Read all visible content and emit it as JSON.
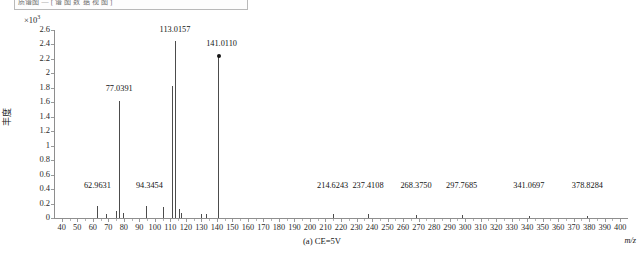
{
  "window": {
    "title_strip_text": "质谱图  —  [ 谱 图 数 据 视 图 ]"
  },
  "axes": {
    "y_exponent_prefix": "×10",
    "y_exponent_power": "3",
    "y_label": "丰度",
    "y_ticks": [
      "2.6",
      "2.4",
      "2.2",
      "2",
      "1.8",
      "1.6",
      "1.4",
      "1.2",
      "1",
      "0.8",
      "0.6",
      "0.4",
      "0.2",
      "0"
    ],
    "y_min": 0,
    "y_max": 2.6,
    "x_ticks": [
      "40",
      "50",
      "60",
      "70",
      "80",
      "90",
      "100",
      "110",
      "120",
      "130",
      "140",
      "150",
      "160",
      "170",
      "180",
      "190",
      "200",
      "210",
      "220",
      "230",
      "240",
      "250",
      "260",
      "270",
      "280",
      "290",
      "300",
      "310",
      "320",
      "330",
      "340",
      "350",
      "360",
      "370",
      "380",
      "390",
      "400"
    ],
    "x_min": 35,
    "x_max": 405,
    "x_axis_label": "m/z"
  },
  "caption": "(a) CE=5V",
  "colors": {
    "peak": "#4c4c4c",
    "axis": "#8e8e8e",
    "text": "#141414",
    "marker": "#151515"
  },
  "chart_data": {
    "type": "bar",
    "title": "",
    "subtitle": "",
    "xlabel": "m/z",
    "ylabel": "丰度",
    "y_scale_factor": 1000,
    "xlim": [
      35,
      405
    ],
    "ylim": [
      0,
      2.6
    ],
    "grid": false,
    "legend": "none",
    "base_peak_mz": 141.011,
    "labeled_peaks": [
      {
        "mz": 62.9631,
        "label": "62.9631",
        "intensity": 0.17,
        "label_x": 62.9631,
        "label_y": 0.44
      },
      {
        "mz": 77.0391,
        "label": "77.0391",
        "intensity": 1.62,
        "label_x": 77.0391,
        "label_y": 1.78
      },
      {
        "mz": 94.3454,
        "label": "94.3454",
        "intensity": 0.16,
        "label_x": 96.5,
        "label_y": 0.44
      },
      {
        "mz": 113.0157,
        "label": "113.0157",
        "intensity": 2.45,
        "label_x": 113.0157,
        "label_y": 2.6
      },
      {
        "mz": 141.011,
        "label": "141.0110",
        "intensity": 2.24,
        "label_x": 143.0,
        "label_y": 2.41,
        "marker": true
      },
      {
        "mz": 214.6243,
        "label": "214.6243",
        "intensity": 0.05,
        "label_x": 214.6243,
        "label_y": 0.44
      },
      {
        "mz": 237.4108,
        "label": "237.4108",
        "intensity": 0.05,
        "label_x": 237.4108,
        "label_y": 0.44
      },
      {
        "mz": 268.375,
        "label": "268.3750",
        "intensity": 0.04,
        "label_x": 268.375,
        "label_y": 0.44
      },
      {
        "mz": 297.7685,
        "label": "297.7685",
        "intensity": 0.04,
        "label_x": 297.7685,
        "label_y": 0.44
      },
      {
        "mz": 341.0697,
        "label": "341.0697",
        "intensity": 0.03,
        "label_x": 341.0697,
        "label_y": 0.44
      },
      {
        "mz": 378.8284,
        "label": "378.8284",
        "intensity": 0.03,
        "label_x": 378.8284,
        "label_y": 0.44
      }
    ],
    "unlabeled_peaks": [
      {
        "mz": 62.9631,
        "intensity": 0.17
      },
      {
        "mz": 68.5,
        "intensity": 0.06
      },
      {
        "mz": 75.0,
        "intensity": 0.1
      },
      {
        "mz": 77.0391,
        "intensity": 1.62
      },
      {
        "mz": 79.5,
        "intensity": 0.07
      },
      {
        "mz": 94.3454,
        "intensity": 0.16
      },
      {
        "mz": 105.2,
        "intensity": 0.15
      },
      {
        "mz": 110.8,
        "intensity": 1.83
      },
      {
        "mz": 113.0157,
        "intensity": 2.45
      },
      {
        "mz": 115.5,
        "intensity": 0.12
      },
      {
        "mz": 117.0,
        "intensity": 0.07
      },
      {
        "mz": 130.0,
        "intensity": 0.05
      },
      {
        "mz": 133.0,
        "intensity": 0.05
      },
      {
        "mz": 141.011,
        "intensity": 2.24
      },
      {
        "mz": 214.6243,
        "intensity": 0.05
      },
      {
        "mz": 237.4108,
        "intensity": 0.05
      },
      {
        "mz": 268.375,
        "intensity": 0.04
      },
      {
        "mz": 297.7685,
        "intensity": 0.04
      },
      {
        "mz": 341.0697,
        "intensity": 0.03
      },
      {
        "mz": 378.8284,
        "intensity": 0.03
      }
    ]
  }
}
